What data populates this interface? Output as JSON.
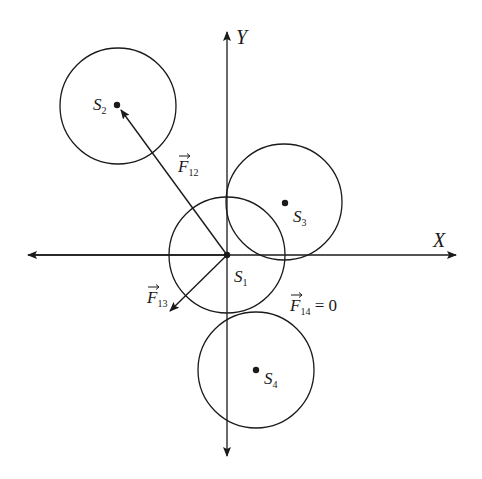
{
  "axes": {
    "x_label": "X",
    "y_label": "Y"
  },
  "spheres": [
    {
      "id": "S1",
      "label": "S",
      "sub": "1",
      "cx": 227,
      "cy": 255,
      "r": 58
    },
    {
      "id": "S2",
      "label": "S",
      "sub": "2",
      "cx": 118,
      "cy": 106,
      "r": 58
    },
    {
      "id": "S3",
      "label": "S",
      "sub": "3",
      "cx": 284,
      "cy": 202,
      "r": 58
    },
    {
      "id": "S4",
      "label": "S",
      "sub": "4",
      "cx": 256,
      "cy": 370,
      "r": 58
    }
  ],
  "forces": {
    "f12": {
      "label": "F",
      "sub": "12"
    },
    "f13": {
      "label": "F",
      "sub": "13"
    },
    "f14": {
      "label": "F",
      "sub": "14",
      "suffix": " = 0"
    }
  },
  "colors": {
    "stroke": "#1a1a1a",
    "background": "#ffffff"
  }
}
